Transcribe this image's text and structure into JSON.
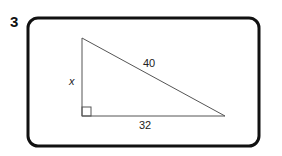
{
  "problem": {
    "number": "3",
    "diagram": {
      "shape": "right-triangle",
      "labels": {
        "vertical_leg": "x",
        "hypotenuse": "40",
        "horizontal_leg": "32"
      },
      "right_angle_marker": true
    }
  },
  "colors": {
    "frame": "#111111",
    "triangle": "#555555"
  }
}
